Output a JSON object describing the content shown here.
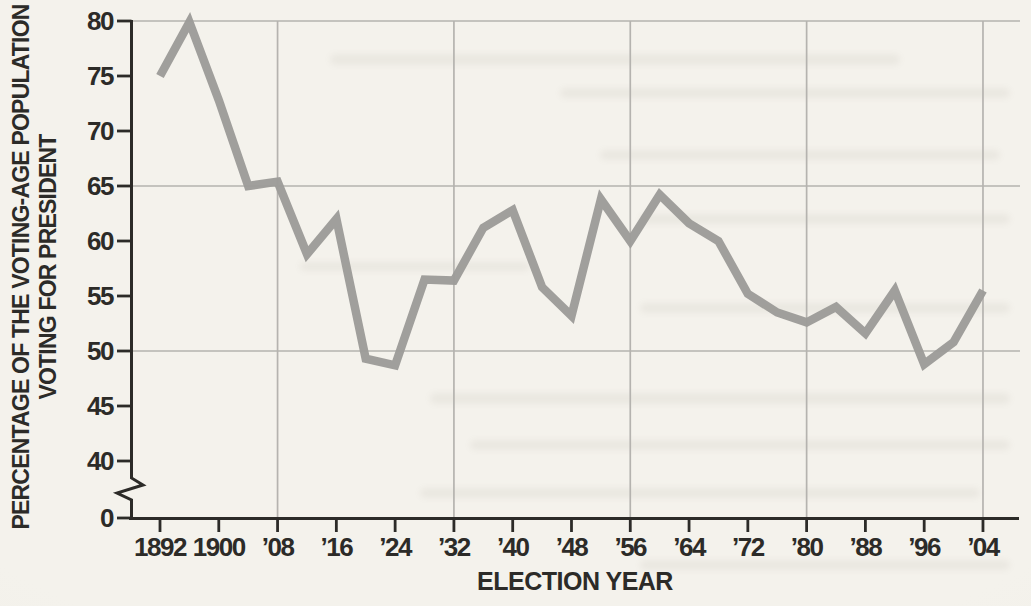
{
  "figure": {
    "kind": "scanned textbook line chart",
    "colors": {
      "paper": "#f2f0ea",
      "ink": "#2c2b28",
      "gridline": "#b5b3af",
      "data_line": "#9d9c99"
    }
  },
  "y_axis": {
    "title_line1": "PERCENTAGE OF THE VOTING-AGE POPULATION",
    "title_line2": "VOTING FOR PRESIDENT",
    "tick_values": [
      80,
      75,
      70,
      65,
      60,
      55,
      50,
      45,
      40,
      0
    ],
    "tick_labels": [
      "80",
      "75",
      "70",
      "65",
      "60",
      "55",
      "50",
      "45",
      "40",
      "0"
    ],
    "axis_break_between": [
      40,
      0
    ]
  },
  "x_axis": {
    "title": "ELECTION YEAR",
    "tick_years": [
      1892,
      1900,
      1908,
      1916,
      1924,
      1932,
      1940,
      1948,
      1956,
      1964,
      1972,
      1980,
      1988,
      1996,
      2004
    ],
    "tick_labels": [
      "1892",
      "1900",
      "’08",
      "’16",
      "’24",
      "’32",
      "’40",
      "’48",
      "’56",
      "’64",
      "’72",
      "’80",
      "’88",
      "’96",
      "’04"
    ]
  },
  "chart_data": {
    "type": "line",
    "title": "",
    "xlabel": "ELECTION YEAR",
    "ylabel": "PERCENTAGE OF THE VOTING-AGE POPULATION VOTING FOR PRESIDENT",
    "x": [
      1892,
      1896,
      1900,
      1904,
      1908,
      1912,
      1916,
      1920,
      1924,
      1928,
      1932,
      1936,
      1940,
      1944,
      1948,
      1952,
      1956,
      1960,
      1964,
      1968,
      1972,
      1976,
      1980,
      1984,
      1988,
      1992,
      1996,
      2000,
      2004
    ],
    "series": [
      {
        "name": "Percentage of voting-age population voting for president",
        "values": [
          75.0,
          79.9,
          72.8,
          65.0,
          65.4,
          58.8,
          62.0,
          49.3,
          48.7,
          56.5,
          56.4,
          61.2,
          62.8,
          55.8,
          53.2,
          63.8,
          60.0,
          64.2,
          61.6,
          60.0,
          55.2,
          53.5,
          52.6,
          54.0,
          51.6,
          55.5,
          48.8,
          50.8,
          55.5
        ]
      }
    ],
    "ylim": [
      0,
      80
    ],
    "axis_break": {
      "between": [
        0,
        40
      ]
    },
    "yticks": [
      0,
      40,
      45,
      50,
      55,
      60,
      65,
      70,
      75,
      80
    ],
    "xticks": [
      1892,
      1900,
      1908,
      1916,
      1924,
      1932,
      1940,
      1948,
      1956,
      1964,
      1972,
      1980,
      1988,
      1996,
      2004
    ],
    "grid": {
      "horizontal_at": [
        50,
        65,
        80
      ],
      "vertical_at_years": [
        1908,
        1932,
        1956,
        1980,
        2004
      ]
    },
    "legend": "none",
    "line_color": "#9d9c99"
  }
}
